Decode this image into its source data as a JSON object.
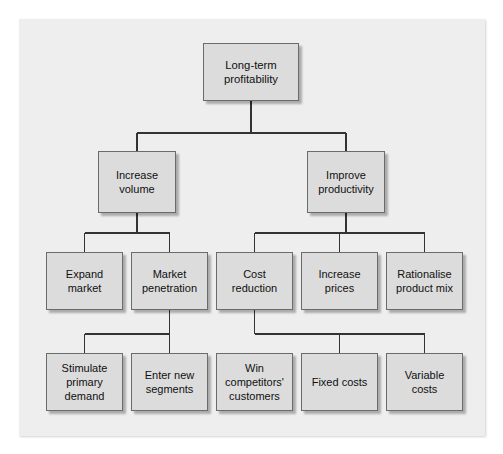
{
  "diagram": {
    "type": "hierarchy-tree",
    "orientation": "top-down",
    "style": {
      "panel_background": "#eeeeee",
      "node_fill": "#dcdcdc",
      "node_border": "#6b6b6b",
      "connector_color": "#333333",
      "text_color": "#101010"
    },
    "nodes": [
      {
        "id": "n0",
        "label": "Long-term\nprofitability",
        "level": 1,
        "x": 203,
        "y": 43,
        "w": 96,
        "h": 58
      },
      {
        "id": "n1",
        "label": "Increase\nvolume",
        "level": 2,
        "x": 98,
        "y": 151,
        "w": 78,
        "h": 62
      },
      {
        "id": "n2",
        "label": "Improve\nproductivity",
        "level": 2,
        "x": 307,
        "y": 151,
        "w": 78,
        "h": 62
      },
      {
        "id": "n3",
        "label": "Expand\nmarket",
        "level": 3,
        "x": 46,
        "y": 252,
        "w": 77,
        "h": 58
      },
      {
        "id": "n4",
        "label": "Market\npenetration",
        "level": 3,
        "x": 131,
        "y": 252,
        "w": 77,
        "h": 58
      },
      {
        "id": "n5",
        "label": "Cost\nreduction",
        "level": 3,
        "x": 216,
        "y": 252,
        "w": 77,
        "h": 58
      },
      {
        "id": "n6",
        "label": "Increase\nprices",
        "level": 3,
        "x": 301,
        "y": 252,
        "w": 77,
        "h": 58
      },
      {
        "id": "n7",
        "label": "Rationalise\nproduct mix",
        "level": 3,
        "x": 386,
        "y": 252,
        "w": 77,
        "h": 58
      },
      {
        "id": "n8",
        "label": "Stimulate\nprimary\ndemand",
        "level": 4,
        "x": 46,
        "y": 353,
        "w": 77,
        "h": 58
      },
      {
        "id": "n9",
        "label": "Enter new\nsegments",
        "level": 4,
        "x": 131,
        "y": 353,
        "w": 77,
        "h": 58
      },
      {
        "id": "n10",
        "label": "Win\ncompetitors'\ncustomers",
        "level": 4,
        "x": 216,
        "y": 353,
        "w": 77,
        "h": 58
      },
      {
        "id": "n11",
        "label": "Fixed costs",
        "level": 4,
        "x": 301,
        "y": 353,
        "w": 77,
        "h": 58
      },
      {
        "id": "n12",
        "label": "Variable\ncosts",
        "level": 4,
        "x": 386,
        "y": 353,
        "w": 77,
        "h": 58
      }
    ],
    "edges": [
      {
        "from": "n0",
        "to": [
          "n1",
          "n2"
        ],
        "bus_y": 133
      },
      {
        "from": "n1",
        "to": [
          "n3",
          "n4"
        ],
        "bus_y": 233
      },
      {
        "from": "n2",
        "to": [
          "n5",
          "n6",
          "n7"
        ],
        "bus_y": 233
      },
      {
        "from": "n4",
        "to": [
          "n8",
          "n9"
        ],
        "bus_y": 334
      },
      {
        "from": "n5",
        "to": [
          "n11",
          "n12"
        ],
        "bus_y": 334
      }
    ]
  }
}
